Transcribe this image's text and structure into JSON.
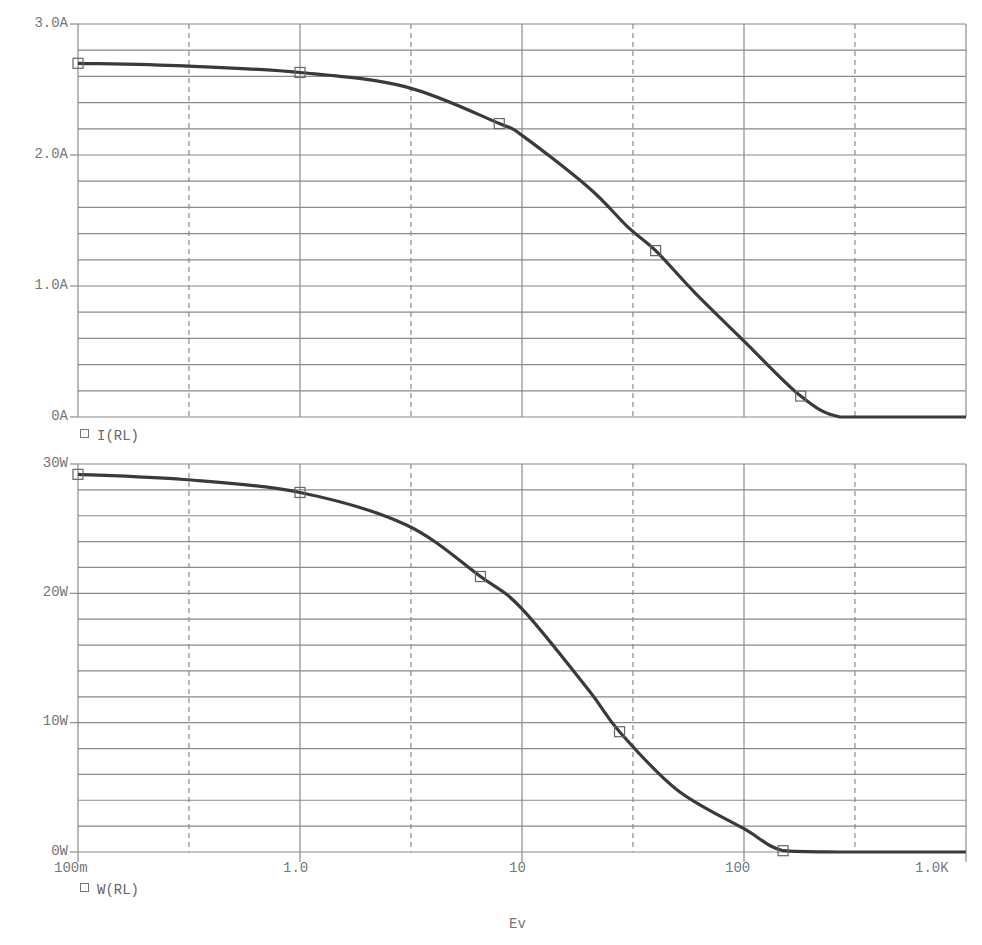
{
  "chart_data": [
    {
      "type": "line",
      "title": "",
      "xlabel": "Ev",
      "ylabel": "",
      "xscale": "log",
      "xlim": [
        0.1,
        1000
      ],
      "ylim": [
        0,
        3.0
      ],
      "grid": true,
      "x_tick_labels": [
        "100m",
        "1.0",
        "10",
        "100",
        "1.0K"
      ],
      "y_tick_labels": [
        "0A",
        "1.0A",
        "2.0A",
        "3.0A"
      ],
      "legend": [
        "I(RL)"
      ],
      "legend_position": "bottom-left",
      "series": [
        {
          "name": "I(RL)",
          "x": [
            0.1,
            0.3,
            1.0,
            3.0,
            7.9,
            10,
            20,
            30,
            40,
            60,
            100,
            180,
            270,
            500,
            1000
          ],
          "values": [
            2.7,
            2.68,
            2.63,
            2.52,
            2.24,
            2.15,
            1.75,
            1.45,
            1.27,
            0.95,
            0.58,
            0.16,
            0.0,
            0.0,
            0.0
          ],
          "markers_x": [
            0.1,
            1.0,
            7.9,
            40,
            180
          ],
          "markers_y": [
            2.7,
            2.63,
            2.24,
            1.27,
            0.16
          ]
        }
      ]
    },
    {
      "type": "line",
      "title": "",
      "xlabel": "Ev",
      "ylabel": "",
      "xscale": "log",
      "xlim": [
        0.1,
        1000
      ],
      "ylim": [
        0,
        30
      ],
      "grid": true,
      "x_tick_labels": [
        "100m",
        "1.0",
        "10",
        "100",
        "1.0K"
      ],
      "y_tick_labels": [
        "0W",
        "10W",
        "20W",
        "30W"
      ],
      "legend": [
        "W(RL)"
      ],
      "legend_position": "bottom-left",
      "series": [
        {
          "name": "W(RL)",
          "x": [
            0.1,
            0.3,
            1.0,
            3.0,
            6.5,
            10,
            20,
            27.5,
            50,
            100,
            150,
            270,
            500,
            1000
          ],
          "values": [
            29.2,
            28.8,
            27.8,
            25.3,
            21.3,
            18.8,
            12.5,
            9.3,
            4.8,
            1.8,
            0.1,
            0.0,
            0.0,
            0.0
          ],
          "markers_x": [
            0.1,
            1.0,
            6.5,
            27.5,
            150
          ],
          "markers_y": [
            29.2,
            27.8,
            21.3,
            9.3,
            0.1
          ]
        }
      ]
    }
  ],
  "top": {
    "ticks": [
      "3.0A",
      "2.0A",
      "1.0A",
      "0A"
    ],
    "legend": "I(RL)"
  },
  "bottom": {
    "ticks": [
      "30W",
      "20W",
      "10W",
      "0W"
    ],
    "legend": "W(RL)"
  },
  "xaxis": {
    "ticks": [
      "100m",
      "1.0",
      "10",
      "100",
      "1.0K"
    ],
    "label": "Ev"
  },
  "colors": {
    "curve": "#3a3a3a",
    "grid": "#8a8a8a",
    "text": "#777777"
  }
}
